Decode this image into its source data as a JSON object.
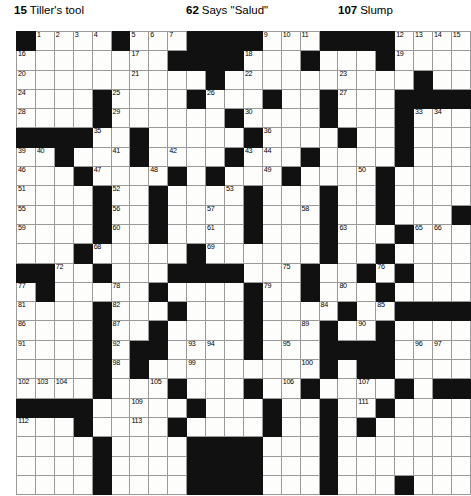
{
  "clue_bar": {
    "clues": [
      {
        "number": "15",
        "text": "Tiller's tool"
      },
      {
        "number": "62",
        "text": "Says \"Salud\""
      },
      {
        "number": "107",
        "text": "Slump"
      }
    ]
  },
  "crossword": {
    "columns": 24,
    "rows": 24,
    "cell_color": "#fdfdfb",
    "block_color": "#111111",
    "border_color": "#9a9a9a",
    "grid": [
      "#....#...####...####....",
      "........####...#...#....",
      "..........#..........#..",
      "....#....#...#..#...####",
      "....#......#....#...#...",
      "####..#.....#....#..#...",
      "..#...#....#...#....#...",
      "...#....#.#...#....#....",
      "....#..#....#...#..#....",
      "....#..#....#...#..#...#",
      "....#..#....#...#...#...",
      "...#.....#......#..#....",
      "##..#...####...#..#.#...",
      ".#.....#....#..#...#....",
      "....#...#...#....#..####",
      "....#..#....#...#..#....",
      "....#.##....#...####....",
      "....#.#.........#.##....",
      "....#...#...#..#....#.##",
      "####.....#...#..#..#....",
      "...#....#....#..#.#.....",
      "....#....####...#.......",
      "....#....####...#.......",
      "....#....####...#...#..."
    ],
    "numbers": {
      "r0": [
        [
          "c1",
          "1"
        ],
        [
          "c2",
          "2"
        ],
        [
          "c3",
          "3"
        ],
        [
          "c4",
          "4"
        ],
        [
          "c6",
          "5"
        ],
        [
          "c7",
          "6"
        ],
        [
          "c8",
          "7"
        ],
        [
          "c12",
          "8"
        ],
        [
          "c13",
          "9"
        ],
        [
          "c14",
          "10"
        ],
        [
          "c15",
          "11"
        ],
        [
          "c20",
          "12"
        ],
        [
          "c21",
          "13"
        ],
        [
          "c22",
          "14"
        ],
        [
          "c23",
          "15"
        ]
      ],
      "r1": [
        [
          "c0",
          "16"
        ],
        [
          "c6",
          "17"
        ],
        [
          "c12",
          "18"
        ],
        [
          "c20",
          "19"
        ]
      ],
      "r2": [
        [
          "c0",
          "20"
        ],
        [
          "c6",
          "21"
        ],
        [
          "c12",
          "22"
        ],
        [
          "c17",
          "23"
        ]
      ],
      "r3": [
        [
          "c0",
          "24"
        ],
        [
          "c5",
          "25"
        ],
        [
          "c10",
          "26"
        ],
        [
          "c17",
          "27"
        ]
      ],
      "r4": [
        [
          "c0",
          "28"
        ],
        [
          "c5",
          "29"
        ],
        [
          "c12",
          "30"
        ],
        [
          "c16",
          "31"
        ],
        [
          "c20",
          "32"
        ],
        [
          "c21",
          "33"
        ],
        [
          "c22",
          "34"
        ]
      ],
      "r5": [
        [
          "c4",
          "35"
        ],
        [
          "c13",
          "36"
        ],
        [
          "c17",
          "37"
        ],
        [
          "c20",
          "38"
        ]
      ],
      "r6": [
        [
          "c0",
          "39"
        ],
        [
          "c1",
          "40"
        ],
        [
          "c5",
          "41"
        ],
        [
          "c8",
          "42"
        ],
        [
          "c12",
          "43"
        ],
        [
          "c13",
          "44"
        ],
        [
          "c20",
          "45"
        ]
      ],
      "r7": [
        [
          "c0",
          "46"
        ],
        [
          "c4",
          "47"
        ],
        [
          "c7",
          "48"
        ],
        [
          "c13",
          "49"
        ],
        [
          "c18",
          "50"
        ]
      ],
      "r8": [
        [
          "c0",
          "51"
        ],
        [
          "c5",
          "52"
        ],
        [
          "c11",
          "53"
        ],
        [
          "c16",
          "54"
        ]
      ],
      "r9": [
        [
          "c0",
          "55"
        ],
        [
          "c5",
          "56"
        ],
        [
          "c10",
          "57"
        ],
        [
          "c15",
          "58"
        ]
      ],
      "r10": [
        [
          "c0",
          "59"
        ],
        [
          "c5",
          "60"
        ],
        [
          "c10",
          "61"
        ],
        [
          "c16",
          "62"
        ],
        [
          "c17",
          "63"
        ],
        [
          "c20",
          "64"
        ],
        [
          "c21",
          "65"
        ],
        [
          "c22",
          "66"
        ]
      ],
      "r11": [
        [
          "c3",
          "67"
        ],
        [
          "c4",
          "68"
        ],
        [
          "c10",
          "69"
        ],
        [
          "c16",
          "70"
        ],
        [
          "c19",
          "71"
        ]
      ],
      "r12": [
        [
          "c2",
          "72"
        ],
        [
          "c8",
          "73"
        ],
        [
          "c9",
          "74"
        ],
        [
          "c14",
          "75"
        ],
        [
          "c19",
          "76"
        ]
      ],
      "r13": [
        [
          "c0",
          "77"
        ],
        [
          "c5",
          "78"
        ],
        [
          "c13",
          "79"
        ],
        [
          "c17",
          "80"
        ]
      ],
      "r14": [
        [
          "c0",
          "81"
        ],
        [
          "c5",
          "82"
        ],
        [
          "c12",
          "83"
        ],
        [
          "c16",
          "84"
        ],
        [
          "c19",
          "85"
        ]
      ],
      "r15": [
        [
          "c0",
          "86"
        ],
        [
          "c5",
          "87"
        ],
        [
          "c12",
          "88"
        ],
        [
          "c15",
          "89"
        ],
        [
          "c18",
          "90"
        ]
      ],
      "r16": [
        [
          "c0",
          "91"
        ],
        [
          "c5",
          "92"
        ],
        [
          "c9",
          "93"
        ],
        [
          "c10",
          "94"
        ],
        [
          "c14",
          "95"
        ],
        [
          "c21",
          "96"
        ],
        [
          "c22",
          "97"
        ]
      ],
      "r17": [
        [
          "c5",
          "98"
        ],
        [
          "c9",
          "99"
        ],
        [
          "c15",
          "100"
        ],
        [
          "c19",
          "101"
        ]
      ],
      "r18": [
        [
          "c0",
          "102"
        ],
        [
          "c1",
          "103"
        ],
        [
          "c2",
          "104"
        ],
        [
          "c7",
          "105"
        ],
        [
          "c14",
          "106"
        ],
        [
          "c18",
          "107"
        ]
      ],
      "r19": [
        [
          "c0",
          "108"
        ],
        [
          "c6",
          "109"
        ],
        [
          "c13",
          "110"
        ],
        [
          "c18",
          "111"
        ]
      ],
      "r20": [
        [
          "c0",
          "112"
        ],
        [
          "c6",
          "113"
        ],
        [
          "c13",
          "114"
        ],
        [
          "c18",
          "115"
        ]
      ]
    }
  }
}
